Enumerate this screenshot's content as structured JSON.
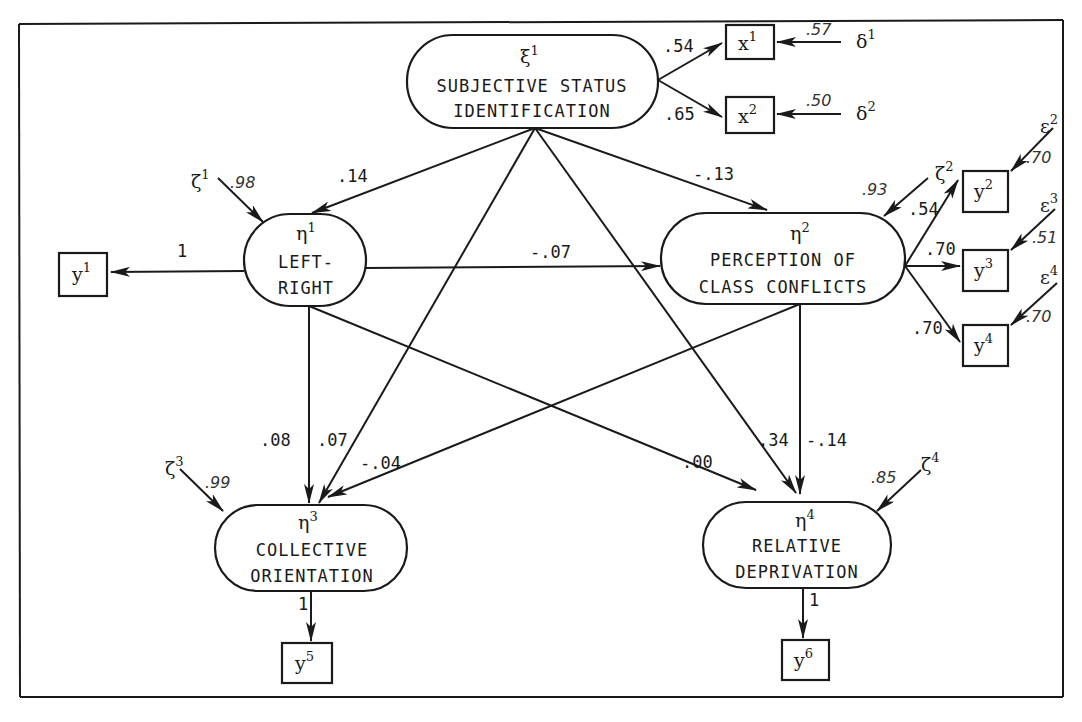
{
  "figure": {
    "type": "structural-equation-path-diagram",
    "frame": true
  },
  "latent": {
    "xi1": {
      "symbol": "ξ",
      "index": "1",
      "line1": "SUBJECTIVE STATUS",
      "line2": "IDENTIFICATION"
    },
    "eta1": {
      "symbol": "η",
      "index": "1",
      "line1": "LEFT-",
      "line2": "RIGHT"
    },
    "eta2": {
      "symbol": "η",
      "index": "2",
      "line1": "PERCEPTION OF",
      "line2": "CLASS CONFLICTS"
    },
    "eta3": {
      "symbol": "η",
      "index": "3",
      "line1": "COLLECTIVE",
      "line2": "ORIENTATION"
    },
    "eta4": {
      "symbol": "η",
      "index": "4",
      "line1": "RELATIVE",
      "line2": "DEPRIVATION"
    }
  },
  "observed": {
    "x1": {
      "symbol": "x",
      "index": "1"
    },
    "x2": {
      "symbol": "x",
      "index": "2"
    },
    "y1": {
      "symbol": "y",
      "index": "1"
    },
    "y2": {
      "symbol": "y",
      "index": "2"
    },
    "y3": {
      "symbol": "y",
      "index": "3"
    },
    "y4": {
      "symbol": "y",
      "index": "4"
    },
    "y5": {
      "symbol": "y",
      "index": "5"
    },
    "y6": {
      "symbol": "y",
      "index": "6"
    }
  },
  "errors": {
    "delta1": {
      "symbol": "δ",
      "index": "1",
      "value": ".57"
    },
    "delta2": {
      "symbol": "δ",
      "index": "2",
      "value": ".50"
    },
    "eps2": {
      "symbol": "ε",
      "index": "2",
      "value": ".70"
    },
    "eps3": {
      "symbol": "ε",
      "index": "3",
      "value": ".51"
    },
    "eps4": {
      "symbol": "ε",
      "index": "4",
      "value": ".70"
    },
    "zeta1": {
      "symbol": "ζ",
      "index": "1",
      "value": ".98"
    },
    "zeta2": {
      "symbol": "ζ",
      "index": "2",
      "value": ".93"
    },
    "zeta3": {
      "symbol": "ζ",
      "index": "3",
      "value": ".99"
    },
    "zeta4": {
      "symbol": "ζ",
      "index": "4",
      "value": ".85"
    }
  },
  "paths": {
    "xi1_x1": ".54",
    "xi1_x2": ".65",
    "xi1_eta1": ".14",
    "xi1_eta2": "-.13",
    "xi1_eta3": ".07",
    "xi1_eta4": ".34",
    "eta1_y1": "1",
    "eta1_eta2": "-.07",
    "eta1_eta3": ".08",
    "eta1_eta4": ".00",
    "eta2_y2": ".54",
    "eta2_y3": ".70",
    "eta2_y4": ".70",
    "eta2_eta3": "-.04",
    "eta2_eta4": "-.14",
    "eta3_y5": "1",
    "eta4_y6": "1"
  }
}
